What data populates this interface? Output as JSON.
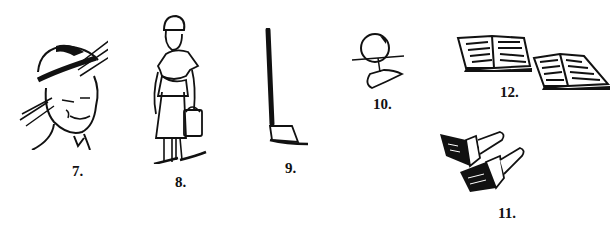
{
  "figures": [
    {
      "number": "7.",
      "subject": "man-in-straw-hat"
    },
    {
      "number": "8.",
      "subject": "woman-carrying-bucket"
    },
    {
      "number": "9.",
      "subject": "hoe"
    },
    {
      "number": "10.",
      "subject": "ball-with-splash"
    },
    {
      "number": "11.",
      "subject": "paintbrushes"
    },
    {
      "number": "12.",
      "subject": "open-books"
    }
  ],
  "colors": {
    "ink": "#111111",
    "paper": "#ffffff"
  }
}
